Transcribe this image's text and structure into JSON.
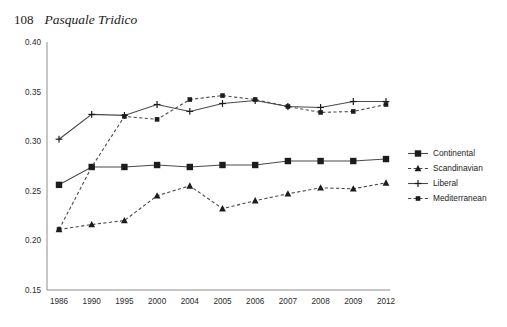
{
  "running_head": {
    "folio": "108",
    "author": "Pasquale Tridico"
  },
  "chart_data": {
    "type": "line",
    "title": "",
    "subtitle": "",
    "xlabel": "",
    "ylabel": "",
    "categories": [
      "1986",
      "1990",
      "1995",
      "2000",
      "2004",
      "2005",
      "2006",
      "2007",
      "2008",
      "2009",
      "2012"
    ],
    "ylim": [
      0.15,
      0.4
    ],
    "yticks": [
      "0.40",
      "0.35",
      "0.30",
      "0.25",
      "0.20",
      "0.15"
    ],
    "ytick_values": [
      0.4,
      0.35,
      0.3,
      0.25,
      0.2,
      0.15
    ],
    "grid": false,
    "legend_position": "right",
    "series": [
      {
        "name": "Continental",
        "marker": "square",
        "dash": false,
        "values": [
          0.256,
          0.274,
          0.274,
          0.276,
          0.274,
          0.276,
          0.276,
          0.28,
          0.28,
          0.28,
          0.282
        ]
      },
      {
        "name": "Scandinavian",
        "marker": "triangle",
        "dash": true,
        "values": [
          0.211,
          0.216,
          0.22,
          0.245,
          0.255,
          0.232,
          0.24,
          0.247,
          0.253,
          0.252,
          0.258
        ]
      },
      {
        "name": "Liberal",
        "marker": "plus",
        "dash": false,
        "values": [
          0.302,
          0.327,
          0.326,
          0.337,
          0.33,
          0.338,
          0.341,
          0.335,
          0.334,
          0.34,
          0.34
        ]
      },
      {
        "name": "Mediterranean",
        "marker": "square-small",
        "dash": true,
        "values": [
          0.211,
          0.274,
          0.325,
          0.322,
          0.342,
          0.346,
          0.342,
          0.335,
          0.329,
          0.33,
          0.337
        ]
      }
    ]
  }
}
